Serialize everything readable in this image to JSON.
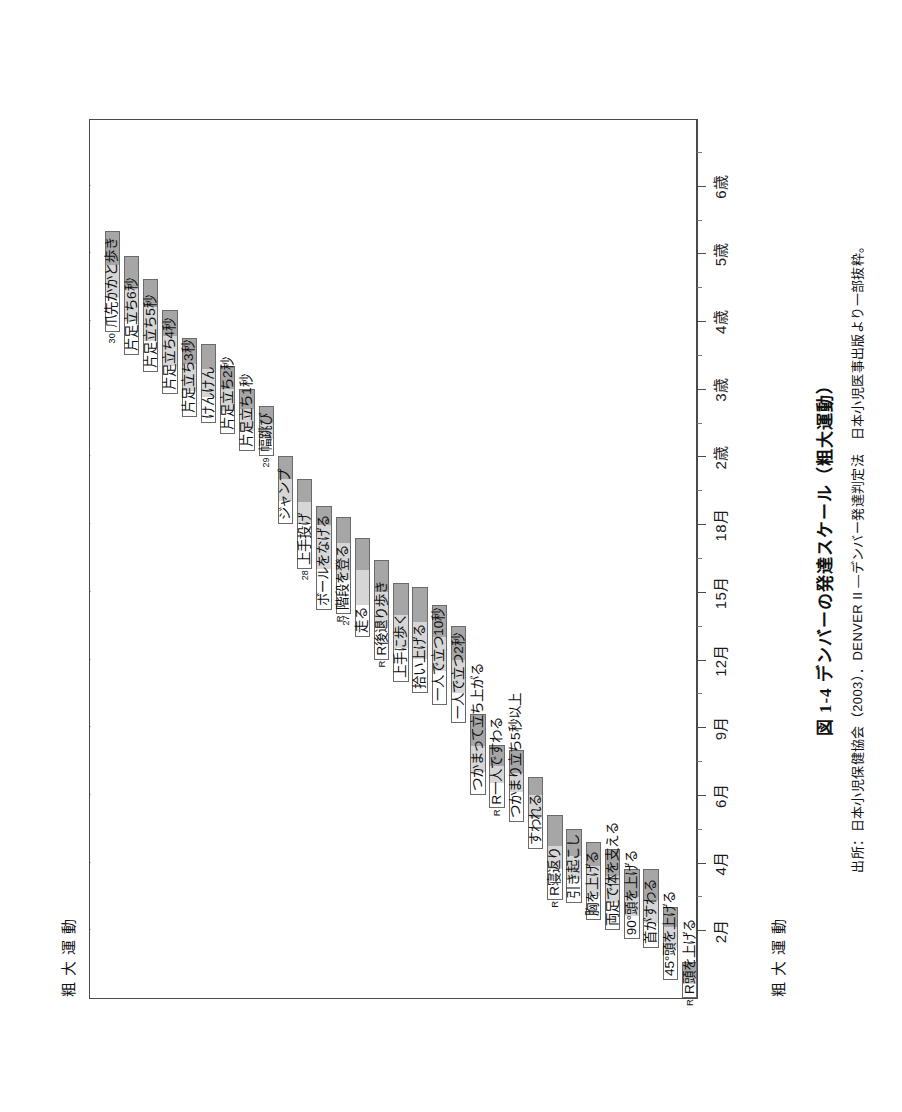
{
  "figure": {
    "caption_number": "図 1-4",
    "caption_text": "デンバーの発達スケール（粗大運動）",
    "source": "出所：日本小児保健協会（2003）．DENVER II ―デンバー発達判定法　日本小児医事出版より一部抜粋。",
    "sector_title_top": "粗大運動",
    "sector_title_bottom": "粗大運動"
  },
  "chart_data": {
    "type": "bar",
    "title": "デンバーの発達スケール（粗大運動）",
    "subtitle": "DENVER II ― デンバー発達判定法（粗大運動領域）",
    "orientation": "rotated-90",
    "xlabel": "年齢",
    "ylabel": "粗大運動の発達項目",
    "grid": true,
    "legend_position": "none",
    "axis": {
      "name": "age",
      "tick_labels": [
        "2月",
        "4月",
        "6月",
        "9月",
        "12月",
        "15月",
        "18月",
        "2歳",
        "3歳",
        "4歳",
        "5歳",
        "6歳"
      ],
      "tick_values_months": [
        2,
        4,
        6,
        9,
        12,
        15,
        18,
        24,
        36,
        48,
        60,
        72
      ],
      "range_months": [
        0.5,
        78
      ],
      "units": "月 / 歳"
    },
    "bar_semantics": {
      "white_left": "25%の小児が通過",
      "light_gray": "50%の小児が通過",
      "dark_gray": "75%の小児が通過",
      "white_right": "90%の小児が通過"
    },
    "categories": [
      "R頭を上げる",
      "45°頭を上げる",
      "首がすわる",
      "90°頭を上げる",
      "両足で体を支える",
      "胸を上げる",
      "引き起こし",
      "R寝返り",
      "すわれる",
      "つかまり立ち5秒以上",
      "R一人ですわる",
      "つかまって立ち上がる",
      "一人で立つ2秒",
      "一人で立つ10秒",
      "拾い上げる",
      "上手に歩く",
      "R後退り歩き",
      "走る",
      "R27階段を登る",
      "ボールをなげる",
      "28上手投げ",
      "ジャンプ",
      "29幅跳び",
      "片足立ち1秒",
      "片足立ち2秒",
      "けんけん",
      "片足立ち3秒",
      "片足立ち4秒",
      "片足立ち5秒",
      "片足立ち6秒",
      "30爪先かかと歩き"
    ],
    "bars": [
      {
        "label": "R頭を上げる",
        "num": "",
        "side": "R",
        "p25": 0.5,
        "p50": 0.8,
        "p75": 1.0,
        "p90": 1.3
      },
      {
        "label": "45°頭を上げる",
        "num": "",
        "side": "",
        "p25": 0.9,
        "p50": 1.6,
        "p75": 2.1,
        "p90": 2.7
      },
      {
        "label": "首がすわる",
        "num": "",
        "side": "",
        "p25": 1.6,
        "p50": 2.2,
        "p75": 2.9,
        "p90": 3.8
      },
      {
        "label": "90°頭を上げる",
        "num": "",
        "side": "",
        "p25": 1.8,
        "p50": 2.4,
        "p75": 3.0,
        "p90": 3.8
      },
      {
        "label": "両足で体を支える",
        "num": "",
        "side": "",
        "p25": 2.0,
        "p50": 2.8,
        "p75": 3.6,
        "p90": 4.4
      },
      {
        "label": "胸を上げる",
        "num": "",
        "side": "",
        "p25": 2.3,
        "p50": 3.0,
        "p75": 3.9,
        "p90": 4.6
      },
      {
        "label": "引き起こし",
        "num": "",
        "side": "",
        "p25": 2.8,
        "p50": 3.5,
        "p75": 4.2,
        "p90": 5.0
      },
      {
        "label": "R寝返り",
        "num": "",
        "side": "R",
        "p25": 2.9,
        "p50": 3.8,
        "p75": 4.5,
        "p90": 5.4
      },
      {
        "label": "すわれる",
        "num": "",
        "side": "",
        "p25": 4.4,
        "p50": 5.3,
        "p75": 6.0,
        "p90": 6.8
      },
      {
        "label": "つかまり立ち5秒以上",
        "num": "",
        "side": "",
        "p25": 5.2,
        "p50": 6.1,
        "p75": 7.0,
        "p90": 8.0
      },
      {
        "label": "R一人ですわる",
        "num": "",
        "side": "R",
        "p25": 5.6,
        "p50": 6.5,
        "p75": 7.3,
        "p90": 8.2
      },
      {
        "label": "つかまって立ち上がる",
        "num": "",
        "side": "",
        "p25": 6.0,
        "p50": 7.0,
        "p75": 8.2,
        "p90": 9.6
      },
      {
        "label": "一人で立つ2秒",
        "num": "",
        "side": "",
        "p25": 9.2,
        "p50": 10.5,
        "p75": 12.0,
        "p90": 13.5
      },
      {
        "label": "一人で立つ10秒",
        "num": "",
        "side": "",
        "p25": 10.0,
        "p50": 11.5,
        "p75": 13.0,
        "p90": 14.4
      },
      {
        "label": "拾い上げる",
        "num": "",
        "side": "",
        "p25": 10.5,
        "p50": 12.0,
        "p75": 13.7,
        "p90": 15.2
      },
      {
        "label": "上手に歩く",
        "num": "",
        "side": "",
        "p25": 11.0,
        "p50": 12.5,
        "p75": 14.0,
        "p90": 15.4
      },
      {
        "label": "R後退り歩き",
        "num": "",
        "side": "R",
        "p25": 12.0,
        "p50": 13.4,
        "p75": 15.0,
        "p90": 16.4
      },
      {
        "label": "走る",
        "num": "",
        "side": "",
        "p25": 13.0,
        "p50": 14.4,
        "p75": 16.0,
        "p90": 17.4
      },
      {
        "label": "階段を登る",
        "num": "27",
        "side": "R",
        "p25": 14.0,
        "p50": 15.5,
        "p75": 17.2,
        "p90": 18.6
      },
      {
        "label": "ボールをなげる",
        "num": "",
        "side": "",
        "p25": 14.2,
        "p50": 16.0,
        "p75": 18.0,
        "p90": 19.6
      },
      {
        "label": "上手投げ",
        "num": "28",
        "side": "",
        "p25": 16.0,
        "p50": 18.0,
        "p75": 20.0,
        "p90": 22.0
      },
      {
        "label": "ジャンプ",
        "num": "",
        "side": "",
        "p25": 18.0,
        "p50": 20.0,
        "p75": 22.0,
        "p90": 24.0
      },
      {
        "label": "幅跳び",
        "num": "29",
        "side": "",
        "p25": 24.0,
        "p50": 27.0,
        "p75": 30.0,
        "p90": 33.0
      },
      {
        "label": "片足立ち1秒",
        "num": "",
        "side": "",
        "p25": 25.0,
        "p50": 28.5,
        "p75": 32.5,
        "p90": 36.0
      },
      {
        "label": "片足立ち2秒",
        "num": "",
        "side": "",
        "p25": 28.0,
        "p50": 32.0,
        "p75": 36.0,
        "p90": 40.0
      },
      {
        "label": "けんけん",
        "num": "",
        "side": "",
        "p25": 30.0,
        "p50": 34.5,
        "p75": 39.5,
        "p90": 44.0
      },
      {
        "label": "片足立ち3秒",
        "num": "",
        "side": "",
        "p25": 31.0,
        "p50": 35.5,
        "p75": 40.5,
        "p90": 45.0
      },
      {
        "label": "片足立ち4秒",
        "num": "",
        "side": "",
        "p25": 35.0,
        "p50": 40.0,
        "p75": 45.5,
        "p90": 50.0
      },
      {
        "label": "片足立ち5秒",
        "num": "",
        "side": "",
        "p25": 39.0,
        "p50": 44.5,
        "p75": 50.5,
        "p90": 55.5
      },
      {
        "label": "片足立ち6秒",
        "num": "",
        "side": "",
        "p25": 42.0,
        "p50": 48.0,
        "p75": 54.0,
        "p90": 59.5
      },
      {
        "label": "爪先かかと歩き",
        "num": "30",
        "side": "",
        "p25": 46.0,
        "p50": 52.0,
        "p75": 58.0,
        "p90": 64.0
      }
    ]
  }
}
